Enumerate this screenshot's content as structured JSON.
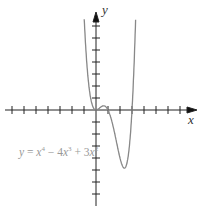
{
  "chart_data": {
    "type": "line",
    "title": "",
    "xlabel": "x",
    "ylabel": "y",
    "equation": "y = x⁴ − 4x³ + 3x²",
    "series": [
      {
        "name": "y = x^4 - 4x^3 + 3x^2",
        "x": [
          -1.1,
          -1,
          -0.5,
          0,
          0.3,
          0.5,
          0.8,
          1,
          1.5,
          2,
          2.25,
          2.5,
          3,
          3.3
        ],
        "y": [
          9.9,
          8,
          1.31,
          0,
          0.19,
          0.31,
          -0.1,
          0,
          -2.81,
          -4,
          -3.47,
          -3.4,
          0,
          7.9
        ]
      }
    ],
    "local_min": {
      "x": 2.22,
      "y": -5.4
    },
    "xlim": [
      -7,
      8
    ],
    "ylim": [
      -7,
      8
    ],
    "x_ticks_spacing": 1,
    "y_ticks_spacing": 1,
    "grid": false,
    "tick_labels": false
  },
  "labels": {
    "x_axis": "x",
    "y_axis": "y"
  },
  "equation_parts": {
    "y": "y",
    "eq": " = ",
    "x1": "x",
    "e1": "4",
    "minus": " − 4",
    "x2": "x",
    "e2": "3",
    "plus": " + 3",
    "x3": "x",
    "e3": "2"
  }
}
